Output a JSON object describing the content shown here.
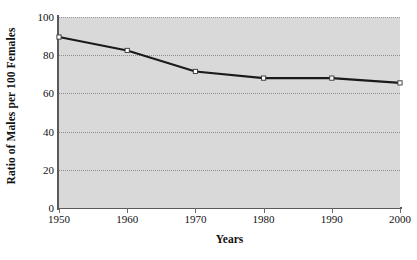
{
  "chart_data": {
    "type": "line",
    "title": "",
    "xlabel": "Years",
    "ylabel": "Ratio of Males per 100 Females",
    "x": [
      1950,
      1960,
      1970,
      1980,
      1990,
      2000
    ],
    "categories": [
      "1950",
      "1960",
      "1970",
      "1980",
      "1990",
      "2000"
    ],
    "values": [
      89.5,
      82.5,
      71.5,
      68.0,
      68.0,
      65.5
    ],
    "series": [
      {
        "name": "Ratio of Males per 100 Females",
        "values": [
          89.5,
          82.5,
          71.5,
          68.0,
          68.0,
          65.5
        ]
      }
    ],
    "xlim": [
      1950,
      2000
    ],
    "ylim": [
      0,
      100
    ],
    "yticks": [
      0,
      20,
      40,
      60,
      80,
      100
    ],
    "ytick_labels": [
      "0",
      "20",
      "40",
      "60",
      "80",
      "100"
    ],
    "xticks": [
      1950,
      1960,
      1970,
      1980,
      1990,
      2000
    ],
    "xtick_labels": [
      "1950",
      "1960",
      "1970",
      "1980",
      "1990",
      "2000"
    ],
    "grid": "horizontal-dotted",
    "legend": "none",
    "marker": "open-square",
    "line_color": "#1a1a1a",
    "marker_face_color": "#ffffff",
    "marker_edge_color": "#333333",
    "plot_background_color": "#d9d9d9",
    "figure_background_color": "#ffffff",
    "grid_color": "#8e8e8e",
    "axis_color": "#5a5a5a"
  }
}
